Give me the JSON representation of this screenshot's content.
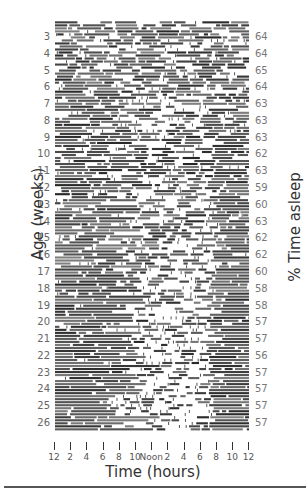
{
  "chart_data": {
    "type": "heatmap",
    "title": "",
    "xlabel": "Time (hours)",
    "ylabel": "Age (weeks)",
    "right_ylabel": "% Time asleep",
    "x_ticks": [
      "12",
      "2",
      "4",
      "6",
      "8",
      "10",
      "Noon",
      "2",
      "4",
      "6",
      "8",
      "10",
      "12"
    ],
    "weeks": [
      3,
      4,
      5,
      6,
      7,
      8,
      9,
      10,
      11,
      12,
      13,
      14,
      15,
      16,
      17,
      18,
      19,
      20,
      21,
      22,
      23,
      24,
      25,
      26
    ],
    "percent_asleep": [
      64,
      64,
      65,
      64,
      63,
      63,
      63,
      62,
      63,
      59,
      60,
      63,
      62,
      62,
      60,
      58,
      58,
      57,
      57,
      56,
      57,
      57,
      57,
      57
    ],
    "grid": false,
    "legend": null
  },
  "labels": {
    "y_title": "Age (weeks)",
    "right_title": "% Time asleep",
    "x_title": "Time (hours)"
  }
}
